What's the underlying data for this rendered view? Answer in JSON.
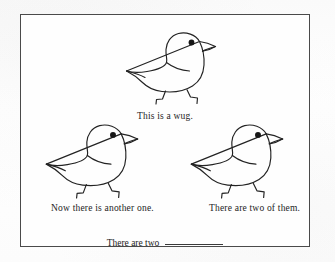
{
  "page": {
    "background_color": "#fdfdfd",
    "frame_color": "#4a4a4a",
    "ink_color": "#1d1d1d"
  },
  "illustration": {
    "subject": "wug-bird",
    "description": "Line drawing of a small blue-bird-like creature facing right",
    "count_shown": 3,
    "birds": [
      {
        "id": "bird-top",
        "position": "top-center",
        "eye": "filled-dot",
        "facing": "right"
      },
      {
        "id": "bird-left",
        "position": "middle-left",
        "eye": "filled-dot",
        "facing": "right"
      },
      {
        "id": "bird-right",
        "position": "middle-right",
        "eye": "filled-dot",
        "facing": "right"
      }
    ]
  },
  "captions": {
    "top": "This is a wug.",
    "left": "Now there is another one.",
    "right": "There are two of them.",
    "bottom_prompt": "There are two",
    "bottom_blank": "__________"
  }
}
